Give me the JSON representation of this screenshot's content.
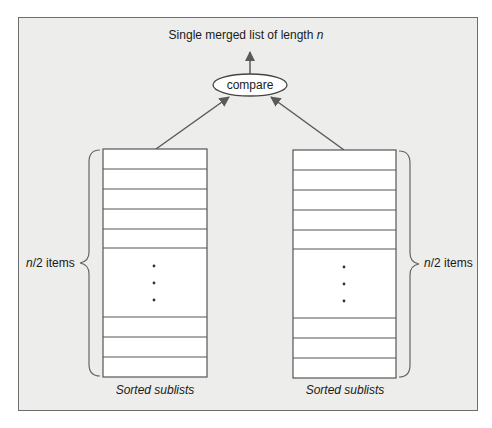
{
  "diagram": {
    "title_prefix": "Single merged list of length ",
    "title_var": "n",
    "compare_node": "compare",
    "left_list": {
      "caption": "Sorted sublists",
      "count_var": "n",
      "count_suffix": "/2 items",
      "top_rows": 5,
      "bottom_rows": 3,
      "ellipsis": "vertical dots"
    },
    "right_list": {
      "caption": "Sorted sublists",
      "count_var": "n",
      "count_suffix": "/2 items",
      "top_rows": 5,
      "bottom_rows": 3,
      "ellipsis": "vertical dots"
    },
    "edges": [
      {
        "from": "left_list",
        "to": "compare"
      },
      {
        "from": "right_list",
        "to": "compare"
      },
      {
        "from": "compare",
        "to": "merged_list"
      }
    ],
    "colors": {
      "background": "#ededeb",
      "frame": "#6e6e6e",
      "list_fill": "#ffffff",
      "line": "#555555",
      "arrow": "#5a5a5a"
    }
  }
}
